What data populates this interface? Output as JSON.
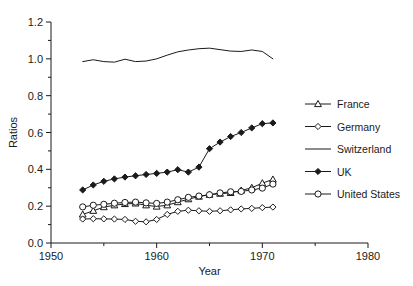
{
  "chart_data": {
    "type": "line",
    "title": "",
    "xlabel": "Year",
    "ylabel": "Ratios",
    "xlim": [
      1950,
      1980
    ],
    "ylim": [
      0.0,
      1.2
    ],
    "xticks": [
      1950,
      1960,
      1970,
      1980
    ],
    "xtick_labels": [
      "1950",
      "1960",
      "1970",
      "1980"
    ],
    "xminor_step": 5,
    "yticks": [
      0.0,
      0.2,
      0.4,
      0.6,
      0.8,
      1.0,
      1.2
    ],
    "ytick_labels": [
      "0.0",
      "0.2",
      "0.4",
      "0.6",
      "0.8",
      "1.0",
      "1.2"
    ],
    "yminor_step": 0.1,
    "grid": false,
    "legend_position": "right",
    "x": [
      1953,
      1954,
      1955,
      1956,
      1957,
      1958,
      1959,
      1960,
      1961,
      1962,
      1963,
      1964,
      1965,
      1966,
      1967,
      1968,
      1969,
      1970,
      1971
    ],
    "series": [
      {
        "name": "France",
        "marker": "open-triangle",
        "values": [
          0.155,
          0.175,
          0.195,
          0.205,
          0.212,
          0.215,
          0.205,
          0.198,
          0.205,
          0.222,
          0.238,
          0.252,
          0.262,
          0.268,
          0.272,
          0.285,
          0.3,
          0.325,
          0.345
        ]
      },
      {
        "name": "Germany",
        "marker": "open-diamond",
        "values": [
          0.13,
          0.132,
          0.131,
          0.13,
          0.128,
          0.118,
          0.115,
          0.128,
          0.155,
          0.172,
          0.178,
          0.175,
          0.172,
          0.175,
          0.18,
          0.185,
          0.188,
          0.192,
          0.195
        ]
      },
      {
        "name": "Switzerland",
        "marker": "none",
        "values": [
          0.985,
          0.995,
          0.985,
          0.982,
          0.998,
          0.985,
          0.988,
          1.0,
          1.02,
          1.038,
          1.048,
          1.055,
          1.058,
          1.05,
          1.042,
          1.04,
          1.048,
          1.04,
          1.0
        ]
      },
      {
        "name": "UK",
        "marker": "filled-diamond",
        "values": [
          0.288,
          0.315,
          0.335,
          0.348,
          0.358,
          0.365,
          0.372,
          0.378,
          0.385,
          0.398,
          0.385,
          0.412,
          0.512,
          0.548,
          0.578,
          0.6,
          0.625,
          0.648,
          0.652
        ]
      },
      {
        "name": "United States",
        "marker": "open-circle",
        "values": [
          0.196,
          0.205,
          0.21,
          0.216,
          0.22,
          0.222,
          0.218,
          0.215,
          0.222,
          0.235,
          0.248,
          0.255,
          0.262,
          0.272,
          0.278,
          0.28,
          0.288,
          0.298,
          0.32
        ]
      }
    ]
  },
  "legend": {
    "entries": [
      {
        "label": "France"
      },
      {
        "label": "Germany"
      },
      {
        "label": "Switzerland"
      },
      {
        "label": "UK"
      },
      {
        "label": "United States"
      }
    ]
  },
  "colors": {
    "axis": "#1a1a1a",
    "line": "#1a1a1a",
    "background": "#ffffff"
  }
}
